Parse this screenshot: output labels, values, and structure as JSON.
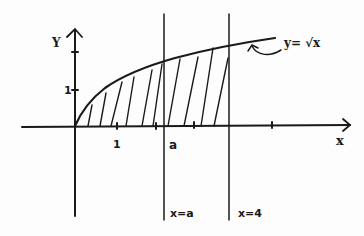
{
  "figure": {
    "function_label": "y= √x",
    "axis_labels": {
      "x": "x",
      "y": "Y"
    },
    "tick_labels": {
      "x_one": "1",
      "x_a": "a",
      "y_one": "1"
    },
    "vertical_lines": [
      {
        "label": "x=a"
      },
      {
        "label": "x=4"
      }
    ],
    "shading": "hatched region under y=√x from x=0 to x=4",
    "colors": {
      "ink": "#1a1a1a",
      "background": "#fdfdfd"
    }
  }
}
